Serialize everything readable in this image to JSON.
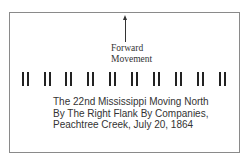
{
  "diagram": {
    "arrow": {
      "direction": "up",
      "icon": "arrow-up-icon"
    },
    "forward_label": [
      "Forward",
      "Movement"
    ],
    "companies_count": 10,
    "caption": [
      "The 22nd Mississippi Moving North",
      "By The Right Flank By Companies,",
      "Peachtree Creek, July 20, 1864"
    ]
  }
}
